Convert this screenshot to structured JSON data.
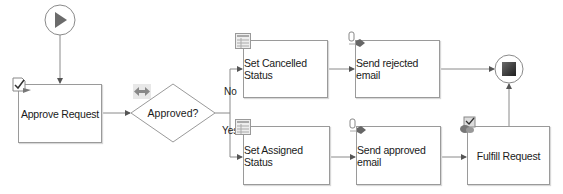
{
  "diagram": {
    "start": {
      "icon": "play-icon"
    },
    "end": {
      "icon": "stop-icon"
    },
    "nodes": {
      "approve_request": "Approve Request",
      "approved_decision": "Approved?",
      "set_cancelled_status": "Set Cancelled Status",
      "send_rejected_email": "Send rejected email",
      "set_assigned_status": "Set Assigned Status",
      "send_approved_email": "Send approved email",
      "fulfill_request": "Fulfill Request"
    },
    "branch_labels": {
      "no": "No",
      "yes": "Yes"
    },
    "colors": {
      "line": "#8a8a8a",
      "border": "#9a9a9a",
      "play": "#6b6b6b",
      "stop": "#3a3a3a"
    }
  }
}
